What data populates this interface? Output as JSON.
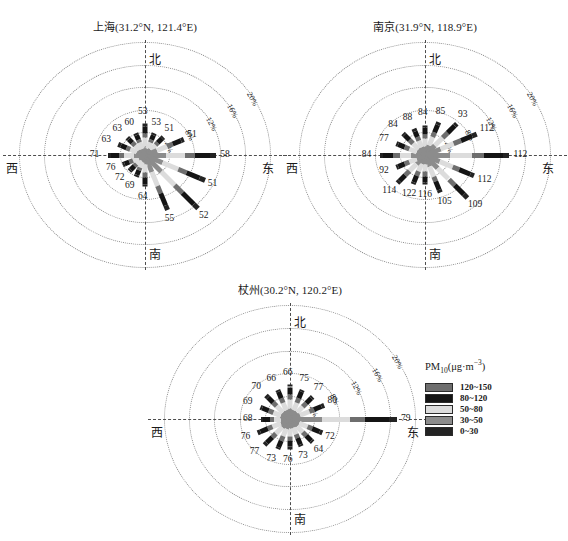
{
  "figure": {
    "kind": "pollution-rose-triptych",
    "legend": {
      "title_main": "PM",
      "title_sub": "10",
      "title_unit_open": "(μg·m",
      "title_unit_sup": "−3",
      "title_unit_close": ")",
      "title_full": "PM10(μg·m−3)",
      "entries": [
        {
          "label": "120~150",
          "color": "#6e6e6e"
        },
        {
          "label": "80~120",
          "color": "#141414"
        },
        {
          "label": "50~80",
          "color": "#dcdcdc"
        },
        {
          "label": "30~50",
          "color": "#8c8c8c"
        },
        {
          "label": "0~30",
          "color": "#232323"
        }
      ]
    },
    "cardinals": {
      "north": "北",
      "south": "南",
      "east": "东",
      "west": "西"
    },
    "ring_labels": [
      "4%",
      "8%",
      "12%",
      "16%",
      "20%"
    ]
  },
  "chart_data": [
    {
      "type": "bar",
      "subtype": "wind-pollution-rose",
      "title": "上海(31.2°N, 121.4°E)",
      "city": "上海",
      "lat": "31.2°N",
      "lon": "121.4°E",
      "rlabel": "frequency (%)",
      "rmax": 20,
      "ring_values": [
        4,
        8,
        12,
        16,
        20
      ],
      "grid": true,
      "value_unit": "μg·m−3",
      "value_name": "PM10 concentration",
      "directions": [
        "N",
        "NNE",
        "NE",
        "ENE",
        "E",
        "ESE",
        "SE",
        "SSE",
        "S",
        "SSW",
        "SW",
        "WSW",
        "W",
        "WNW",
        "NW",
        "NNW"
      ],
      "frequencies": [
        5.6,
        4.2,
        4.4,
        6.8,
        11.3,
        10.4,
        12.6,
        10.2,
        5.5,
        4.0,
        3.6,
        3.8,
        5.9,
        4.6,
        4.2,
        4.2
      ],
      "values": [
        53,
        53,
        51,
        51,
        58,
        51,
        52,
        55,
        64,
        69,
        72,
        76,
        71,
        63,
        63,
        60
      ],
      "value_labels": [
        "53",
        "53",
        "51",
        "51",
        "58",
        "51",
        "52",
        "55",
        "64",
        "69",
        "72",
        "76",
        "71",
        "63",
        "63",
        "60"
      ]
    },
    {
      "type": "bar",
      "subtype": "wind-pollution-rose",
      "title": "南京(31.9°N, 118.9°E)",
      "city": "南京",
      "lat": "31.9°N",
      "lon": "118.9°E",
      "rlabel": "frequency (%)",
      "rmax": 20,
      "ring_values": [
        4,
        8,
        12,
        16,
        20
      ],
      "grid": true,
      "value_unit": "μg·m−3",
      "value_name": "PM10 concentration",
      "directions": [
        "N",
        "NNE",
        "NE",
        "ENE",
        "E",
        "ESE",
        "SE",
        "SSE",
        "S",
        "SSW",
        "SW",
        "WSW",
        "W",
        "WNW",
        "NW",
        "NNW"
      ],
      "frequencies": [
        5.4,
        6.2,
        7.6,
        9.0,
        13.4,
        8.6,
        10.0,
        7.0,
        5.2,
        5.4,
        6.6,
        5.0,
        7.2,
        5.0,
        5.2,
        5.0
      ],
      "values": [
        84,
        85,
        93,
        112,
        112,
        112,
        109,
        105,
        116,
        122,
        114,
        92,
        84,
        77,
        84,
        88
      ],
      "value_labels": [
        "84",
        "85",
        "93",
        "112",
        "112",
        "112",
        "109",
        "105",
        "116",
        "122",
        "114",
        "92",
        "84",
        "77",
        "84",
        "88"
      ]
    },
    {
      "type": "bar",
      "subtype": "wind-pollution-rose",
      "title": "杖州(30.2°N, 120.2°E)",
      "city": "杖州",
      "lat": "30.2°N",
      "lon": "120.2°E",
      "rlabel": "frequency (%)",
      "rmax": 20,
      "ring_values": [
        4,
        8,
        12,
        16,
        20
      ],
      "grid": true,
      "value_unit": "μg·m−3",
      "value_name": "PM10 concentration",
      "directions": [
        "N",
        "NNE",
        "NE",
        "ENE",
        "E",
        "ESE",
        "SE",
        "SSE",
        "S",
        "SSW",
        "SW",
        "WSW",
        "W",
        "WNW",
        "NW",
        "NNW"
      ],
      "frequencies": [
        6.2,
        5.6,
        5.4,
        6.0,
        17.0,
        5.6,
        5.4,
        5.0,
        5.2,
        5.6,
        6.0,
        5.6,
        4.6,
        5.2,
        5.6,
        5.6
      ],
      "values": [
        66,
        75,
        77,
        80,
        79,
        72,
        64,
        73,
        76,
        73,
        77,
        76,
        68,
        69,
        70,
        66
      ],
      "value_labels": [
        "66",
        "75",
        "77",
        "80",
        "79",
        "72",
        "64",
        "73",
        "76",
        "73",
        "77",
        "76",
        "68",
        "69",
        "70",
        "66"
      ]
    }
  ]
}
